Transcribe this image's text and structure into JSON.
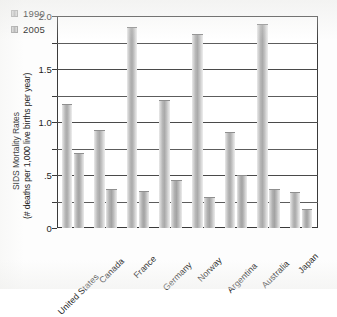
{
  "chart_data": {
    "type": "bar",
    "title": "",
    "subtitle": "",
    "xlabel": "",
    "ylabel_line1": "SIDS Mortality Rates",
    "ylabel_line2": "(# deaths per 1,000 live births per year)",
    "categories": [
      "United States",
      "Canada",
      "France",
      "Germany",
      "Norway",
      "Argentina",
      "Australia",
      "Japan"
    ],
    "series": [
      {
        "name": "1990",
        "values": [
          1.17,
          0.92,
          1.9,
          1.21,
          1.83,
          0.91,
          1.92,
          0.34
        ]
      },
      {
        "name": "2005",
        "values": [
          0.71,
          0.37,
          0.35,
          0.45,
          0.29,
          0.5,
          0.37,
          0.18
        ]
      }
    ],
    "ylim": [
      0,
      2.0
    ],
    "ytick_values": [
      0,
      0.25,
      0.5,
      0.75,
      1.0,
      1.25,
      1.5,
      1.75,
      2.0
    ],
    "ytick_labels": [
      "0",
      "",
      ".5",
      "",
      "1.0",
      "",
      "1.5",
      "",
      "2.0"
    ],
    "grid": "horizontal",
    "legend_position": "top-left"
  },
  "legend": {
    "entries": [
      {
        "label": "1990",
        "swatch": "legend-swatch-1990"
      },
      {
        "label": "2005",
        "swatch": "legend-swatch-2005"
      }
    ]
  },
  "colors": {
    "axis": "#3a3a3a",
    "gridline": "#4a4a4a",
    "bar_mid": "#a8a8a8",
    "bar_light": "#eaeaea",
    "text": "#1e1e1e",
    "background": "#ffffff"
  }
}
